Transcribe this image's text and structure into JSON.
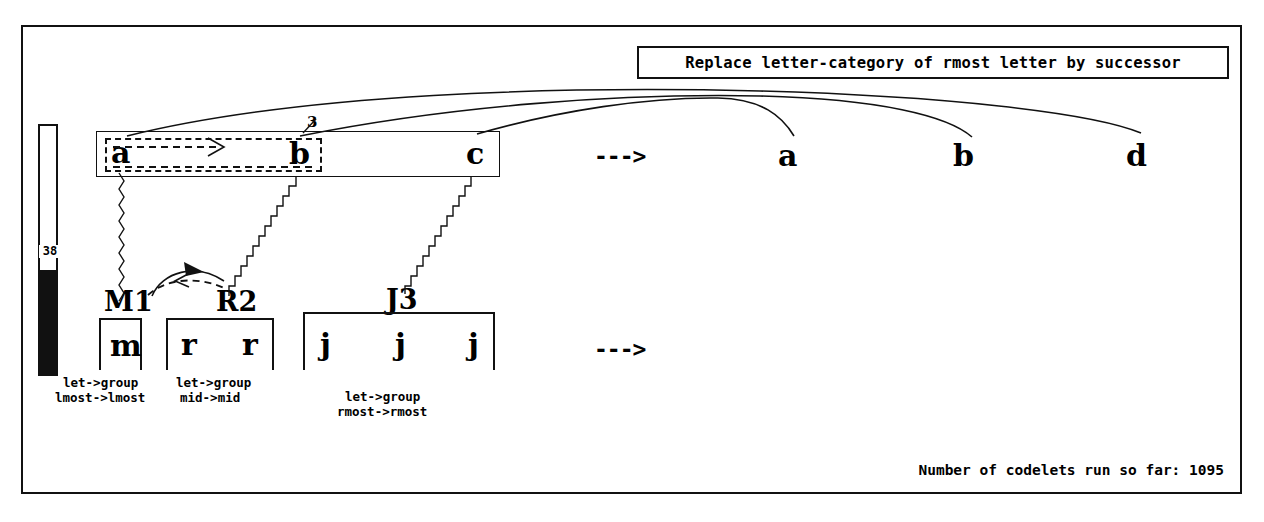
{
  "window": {
    "title": "Copycat Workspace"
  },
  "rule": {
    "text": "Replace letter-category of rmost letter by successor"
  },
  "temperature": {
    "value": "38",
    "fill_percent": 42
  },
  "initial_string": {
    "letters": [
      "a",
      "b",
      "c"
    ],
    "bond_label": "3"
  },
  "target_string": {
    "letters": [
      "a",
      "b",
      "d"
    ]
  },
  "arrows": {
    "top": "--->",
    "bottom": "--->"
  },
  "groups": [
    {
      "name": "M1",
      "letters": [
        "m"
      ],
      "description_line1": "let->group",
      "description_line2": "lmost->lmost"
    },
    {
      "name": "R2",
      "letters": [
        "r",
        "r"
      ],
      "description_line1": "let->group",
      "description_line2": "mid->mid"
    },
    {
      "name": "J3",
      "letters": [
        "j",
        "j",
        "j"
      ],
      "description_line1": "let->group",
      "description_line2": "rmost->rmost"
    }
  ],
  "footer": {
    "codelets_label": "Number of codelets run so far: 1095"
  },
  "colors": {
    "ink": "#111111",
    "background": "#ffffff"
  }
}
